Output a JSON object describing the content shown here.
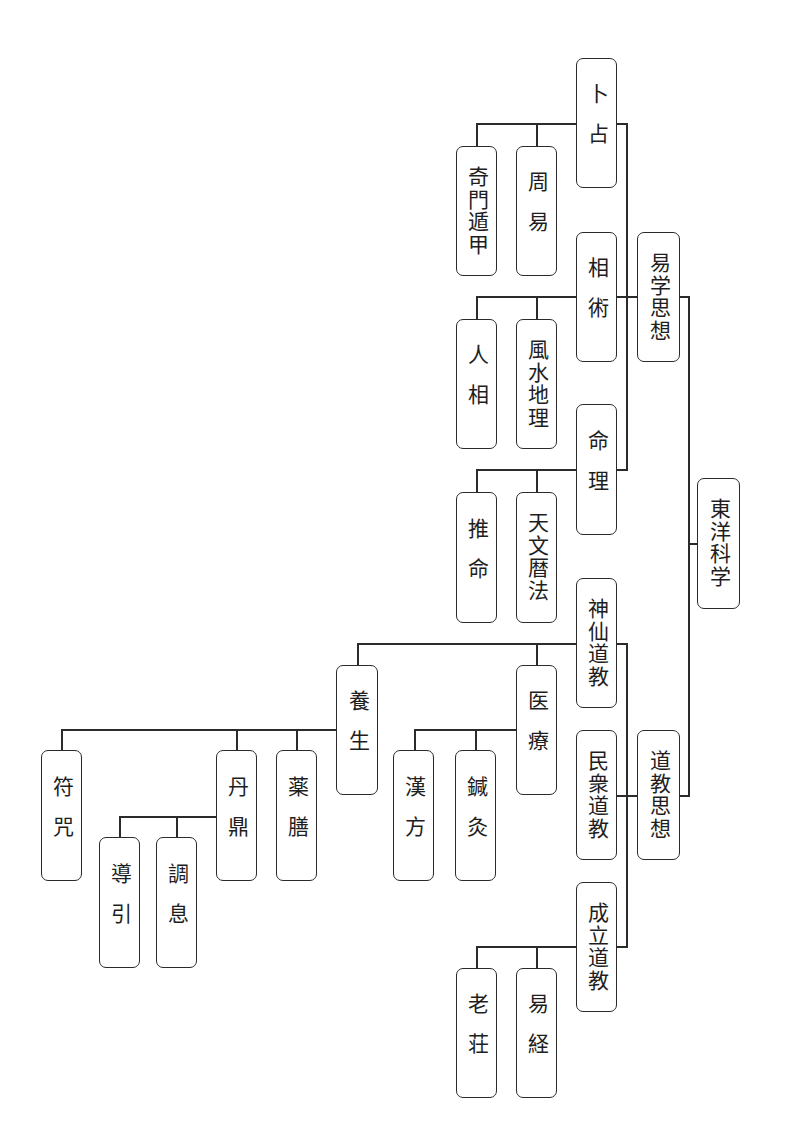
{
  "diagram": {
    "title": "東洋科学",
    "orientation": "rotated-90-clockwise tree (root at right, leaves at left)",
    "line_color": "#2b2b2b",
    "box_border_color": "#2b2b2b",
    "background": "#ffffff",
    "nodes": {
      "root": "東洋科学",
      "ekigaku": "易学思想",
      "dokyo": "道教思想",
      "bokusen": "卜占",
      "soujutsu": "相術",
      "meiri": "命理",
      "shinsen": "神仙道教",
      "minshu": "民衆道教",
      "seiritsu": "成立道教",
      "shueki": "周易",
      "kimon": "奇門遁甲",
      "fusui": "風水地理",
      "ninso": "人相",
      "tenmon": "天文暦法",
      "suimei": "推命",
      "iryo": "医療",
      "shinkyu": "鍼灸",
      "kanpo": "漢方",
      "yojo": "養生",
      "yakuzen": "薬膳",
      "tantei": "丹鼎",
      "chosoku": "調息",
      "doin": "導引",
      "fuju": "符咒",
      "ekikyo": "易経",
      "roso": "老荘"
    },
    "hierarchy": {
      "東洋科学": [
        "易学思想",
        "道教思想"
      ],
      "易学思想": [
        "卜占",
        "相術",
        "命理"
      ],
      "卜占": [
        "周易",
        "奇門遁甲"
      ],
      "相術": [
        "風水地理",
        "人相"
      ],
      "命理": [
        "天文暦法",
        "推命"
      ],
      "道教思想": [
        "神仙道教",
        "民衆道教",
        "成立道教"
      ],
      "神仙道教": [
        "医療",
        "養生"
      ],
      "医療": [
        "鍼灸",
        "漢方"
      ],
      "養生": [
        "薬膳",
        "丹鼎",
        "符咒"
      ],
      "丹鼎": [
        "調息",
        "導引"
      ],
      "成立道教": [
        "易経",
        "老荘"
      ]
    }
  }
}
